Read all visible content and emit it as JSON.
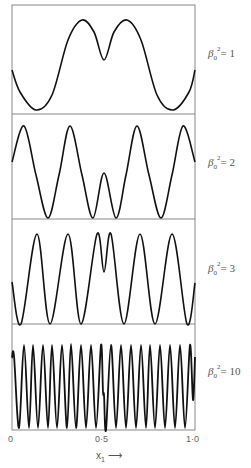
{
  "chart_data": {
    "type": "line",
    "title": "",
    "xlabel": "x1 →",
    "ylabel": "",
    "xlim": [
      0,
      1.0
    ],
    "x_ticks": [
      "0",
      "0·5",
      "1·0"
    ],
    "grid": false,
    "panels": [
      {
        "label_beta": "β",
        "label_sup": "2",
        "label_sub": "0",
        "label_value": "= 1",
        "beta0_squared": 1,
        "y_top": 5,
        "y_bottom": 114,
        "points": [
          [
            12,
            70
          ],
          [
            20,
            92
          ],
          [
            36,
            110
          ],
          [
            52,
            95
          ],
          [
            68,
            40
          ],
          [
            82,
            20
          ],
          [
            94,
            32
          ],
          [
            104,
            60
          ],
          [
            114,
            32
          ],
          [
            127,
            20
          ],
          [
            141,
            40
          ],
          [
            157,
            95
          ],
          [
            173,
            110
          ],
          [
            189,
            92
          ],
          [
            195,
            70
          ]
        ]
      },
      {
        "label_beta": "β",
        "label_sup": "2",
        "label_sub": "0",
        "label_value": "= 2",
        "beta0_squared": 2,
        "y_top": 114,
        "y_bottom": 219,
        "points": [
          [
            12,
            162
          ],
          [
            24,
            126
          ],
          [
            36,
            175
          ],
          [
            48,
            218
          ],
          [
            59,
            175
          ],
          [
            70,
            126
          ],
          [
            82,
            175
          ],
          [
            93,
            218
          ],
          [
            104,
            173
          ],
          [
            116,
            218
          ],
          [
            126,
            175
          ],
          [
            137,
            126
          ],
          [
            149,
            175
          ],
          [
            161,
            218
          ],
          [
            172,
            175
          ],
          [
            183,
            126
          ],
          [
            195,
            162
          ]
        ]
      },
      {
        "label_beta": "β",
        "label_sup": "2",
        "label_sub": "0",
        "label_value": "= 3",
        "beta0_squared": 3,
        "y_top": 219,
        "y_bottom": 324,
        "points": [
          [
            12,
            282
          ],
          [
            21,
            324
          ],
          [
            37,
            234
          ],
          [
            50,
            324
          ],
          [
            68,
            234
          ],
          [
            81,
            324
          ],
          [
            97,
            234
          ],
          [
            104,
            272
          ],
          [
            111,
            234
          ],
          [
            124,
            324
          ],
          [
            140,
            234
          ],
          [
            155,
            324
          ],
          [
            172,
            234
          ],
          [
            187,
            324
          ],
          [
            195,
            283
          ]
        ]
      },
      {
        "label_beta": "β",
        "label_sup": "2",
        "label_sub": "0",
        "label_value": "= 10",
        "beta0_squared": 10,
        "y_top": 324,
        "y_bottom": 430,
        "points": [
          [
            12,
            358
          ],
          [
            14,
            356
          ],
          [
            19,
            428
          ],
          [
            24,
            345
          ],
          [
            29,
            428
          ],
          [
            33,
            345
          ],
          [
            38,
            428
          ],
          [
            43,
            345
          ],
          [
            48,
            428
          ],
          [
            52,
            345
          ],
          [
            57,
            428
          ],
          [
            62,
            345
          ],
          [
            67,
            428
          ],
          [
            71,
            344
          ],
          [
            76,
            428
          ],
          [
            81,
            345
          ],
          [
            86,
            428
          ],
          [
            91,
            345
          ],
          [
            96,
            428
          ],
          [
            101,
            345
          ],
          [
            103,
            392
          ],
          [
            104,
            395
          ],
          [
            106,
            430
          ],
          [
            111,
            345
          ],
          [
            116,
            428
          ],
          [
            121,
            345
          ],
          [
            126,
            428
          ],
          [
            131,
            345
          ],
          [
            136,
            428
          ],
          [
            141,
            345
          ],
          [
            146,
            428
          ],
          [
            150,
            345
          ],
          [
            155,
            428
          ],
          [
            160,
            345
          ],
          [
            165,
            428
          ],
          [
            170,
            345
          ],
          [
            175,
            428
          ],
          [
            180,
            345
          ],
          [
            185,
            428
          ],
          [
            190,
            345
          ],
          [
            193,
            400
          ],
          [
            195,
            357
          ]
        ]
      }
    ]
  },
  "axis": {
    "tick_0": "0",
    "tick_05": "0·5",
    "tick_10": "1·0",
    "xlabel": "x",
    "xlabel_sub": "1",
    "arrow": "⟶"
  },
  "colors": {
    "curve": "#111111",
    "frame": "#888888"
  }
}
